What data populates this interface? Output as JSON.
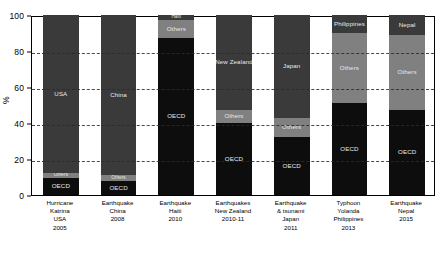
{
  "chart_data": {
    "type": "bar",
    "subtype": "stacked-bar-100-percent",
    "title": "",
    "xlabel": "",
    "ylabel": "%",
    "ylim": [
      0,
      100
    ],
    "yticks": [
      0,
      20,
      40,
      60,
      80,
      100
    ],
    "ytick_labels": [
      "0",
      "20",
      "40",
      "60",
      "80",
      "100"
    ],
    "grid": "horizontal-dashed",
    "legend": "none (in-bar labels)",
    "stack_order": "bottom-to-top",
    "categories": [
      {
        "lines": [
          "Hurricane",
          "Katrina",
          "USA",
          "2005"
        ]
      },
      {
        "lines": [
          "Earthquake",
          "China",
          "2008"
        ]
      },
      {
        "lines": [
          "Earthquake",
          "Haiti",
          "2010"
        ]
      },
      {
        "lines": [
          "Earthquakes",
          "New Zealand",
          "2010-11"
        ]
      },
      {
        "lines": [
          "Earthquake",
          "& tsunami",
          "Japan",
          "2011"
        ]
      },
      {
        "lines": [
          "Typhoon",
          "Yolanda",
          "Philippines",
          "2013"
        ]
      },
      {
        "lines": [
          "Earthquake",
          "Nepal",
          "2015"
        ]
      }
    ],
    "bars": [
      {
        "category": "Hurricane Katrina USA 2005",
        "segments": [
          {
            "name": "OECD",
            "value": 9.5,
            "color": "#0d0d0d",
            "label": "OECD",
            "show_label": true
          },
          {
            "name": "Others",
            "value": 2.5,
            "color": "#808080",
            "label": "Others",
            "show_label": true
          },
          {
            "name": "USA",
            "value": 88.0,
            "color": "#3a3a3a",
            "label": "USA",
            "show_label": true
          }
        ]
      },
      {
        "category": "Earthquake China 2008",
        "segments": [
          {
            "name": "OECD",
            "value": 8.0,
            "color": "#0d0d0d",
            "label": "OECD",
            "show_label": true
          },
          {
            "name": "Others",
            "value": 3.0,
            "color": "#808080",
            "label": "Others",
            "show_label": true
          },
          {
            "name": "China",
            "value": 89.0,
            "color": "#3a3a3a",
            "label": "China",
            "show_label": true
          }
        ]
      },
      {
        "category": "Earthquake Haiti 2010",
        "segments": [
          {
            "name": "OECD",
            "value": 87.0,
            "color": "#0d0d0d",
            "label": "OECD",
            "show_label": true
          },
          {
            "name": "Others",
            "value": 10.0,
            "color": "#808080",
            "label": "Others",
            "show_label": true
          },
          {
            "name": "Haiti",
            "value": 3.0,
            "color": "#3a3a3a",
            "label": "Haiti",
            "show_label": true
          }
        ]
      },
      {
        "category": "Earthquakes New Zealand 2010-11",
        "segments": [
          {
            "name": "OECD",
            "value": 40.0,
            "color": "#0d0d0d",
            "label": "OECD",
            "show_label": true
          },
          {
            "name": "Others",
            "value": 7.0,
            "color": "#808080",
            "label": "Others",
            "show_label": true
          },
          {
            "name": "New Zealand",
            "value": 53.0,
            "color": "#3a3a3a",
            "label": "New Zealand",
            "show_label": true
          }
        ]
      },
      {
        "category": "Earthquake & tsunami Japan 2011",
        "segments": [
          {
            "name": "OECD",
            "value": 32.0,
            "color": "#0d0d0d",
            "label": "OECD",
            "show_label": true
          },
          {
            "name": "Others",
            "value": 11.0,
            "color": "#808080",
            "label": "Others",
            "show_label": true
          },
          {
            "name": "Japan",
            "value": 57.0,
            "color": "#3a3a3a",
            "label": "Japan",
            "show_label": true
          }
        ]
      },
      {
        "category": "Typhoon Yolanda Philippines 2013",
        "segments": [
          {
            "name": "OECD",
            "value": 51.0,
            "color": "#0d0d0d",
            "label": "OECD",
            "show_label": true
          },
          {
            "name": "Others",
            "value": 39.0,
            "color": "#808080",
            "label": "Others",
            "show_label": true
          },
          {
            "name": "Philippines",
            "value": 10.0,
            "color": "#3a3a3a",
            "label": "Philippines",
            "show_label": true
          }
        ]
      },
      {
        "category": "Earthquake Nepal 2015",
        "segments": [
          {
            "name": "OECD",
            "value": 47.0,
            "color": "#0d0d0d",
            "label": "OECD",
            "show_label": true
          },
          {
            "name": "Others",
            "value": 42.0,
            "color": "#808080",
            "label": "Others",
            "show_label": true
          },
          {
            "name": "Nepal",
            "value": 11.0,
            "color": "#3a3a3a",
            "label": "Nepal",
            "show_label": true
          }
        ]
      }
    ],
    "colors": {
      "oecd": "#0d0d0d",
      "others": "#808080",
      "country": "#3a3a3a",
      "background": "#ffffff",
      "axis": "#000000",
      "gridline": "#2b2b2b",
      "in_bar_text": "#e8e8e8"
    }
  }
}
